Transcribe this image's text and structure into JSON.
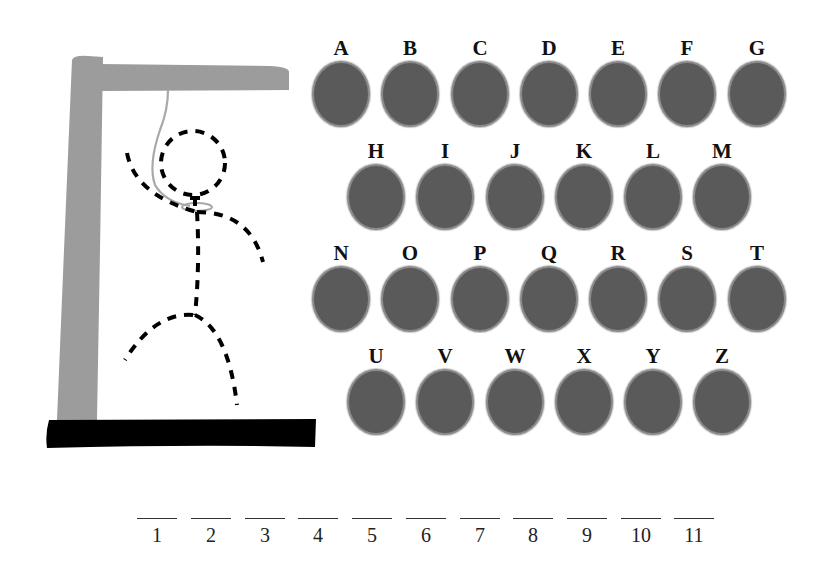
{
  "game": {
    "type": "hangman",
    "word_length": 11
  },
  "colors": {
    "gallows_wood": "#9c9c9c",
    "gallows_base": "#000000",
    "rope": "#a8a8a8",
    "figure": "#000000",
    "oval_fill": "#5a5a5a",
    "oval_border": "#8a8a8a",
    "letter_text": "#111111"
  },
  "keyboard": {
    "rows": [
      [
        "A",
        "B",
        "C",
        "D",
        "E",
        "F",
        "G"
      ],
      [
        "H",
        "I",
        "J",
        "K",
        "L",
        "M"
      ],
      [
        "N",
        "O",
        "P",
        "Q",
        "R",
        "S",
        "T"
      ],
      [
        "U",
        "V",
        "W",
        "X",
        "Y",
        "Z"
      ]
    ],
    "letters": [
      "A",
      "B",
      "C",
      "D",
      "E",
      "F",
      "G",
      "H",
      "I",
      "J",
      "K",
      "L",
      "M",
      "N",
      "O",
      "P",
      "Q",
      "R",
      "S",
      "T",
      "U",
      "V",
      "W",
      "X",
      "Y",
      "Z"
    ]
  },
  "blanks": {
    "numbers": [
      "1",
      "2",
      "3",
      "4",
      "5",
      "6",
      "7",
      "8",
      "9",
      "10",
      "11"
    ]
  },
  "hangman_figure": {
    "parts_drawn": [
      "head",
      "body",
      "left-arm",
      "right-arm",
      "left-leg",
      "right-leg"
    ],
    "style": "dashed"
  }
}
